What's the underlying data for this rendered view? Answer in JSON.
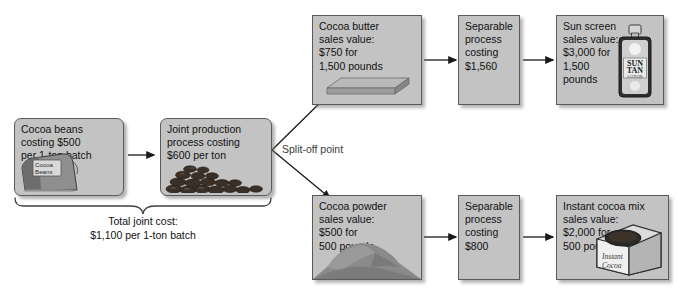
{
  "diagram": {
    "split_label": "Split-off point",
    "joint_cost_note": "Total joint cost:\n$1,100 per 1-ton batch",
    "colors": {
      "box_fill": "#c3c3c3",
      "box_border": "#5a5a5a",
      "text": "#111111",
      "split_label": "#3a3a3a",
      "background": "#ffffff"
    },
    "boxes": {
      "cocoa_beans": {
        "text": "Cocoa beans\ncosting $500\nper 1-ton batch",
        "icon": "cocoa-beans-sack",
        "icon_label": "Cocoa\nBeans"
      },
      "joint_process": {
        "text": "Joint production\nprocess costing\n$600 per ton",
        "icon": "cocoa-bean-pile"
      },
      "cocoa_butter": {
        "text": "Cocoa butter\nsales value:\n$750 for\n1,500 pounds",
        "icon": "butter-bar"
      },
      "separable_upper": {
        "text": "Separable\nprocess\ncosting\n$1,560"
      },
      "sun_screen": {
        "text": "Sun screen\nsales value:\n$3,000 for\n1,500\npounds",
        "icon": "sun-tan-lotion-bottle",
        "icon_label_1": "SUN",
        "icon_label_2": "TAN",
        "icon_label_3": "LOTION"
      },
      "cocoa_powder": {
        "text": "Cocoa powder\nsales value:\n$500 for\n500 pounds",
        "icon": "cocoa-powder-mound"
      },
      "separable_lower": {
        "text": "Separable\nprocess\ncosting\n$800"
      },
      "instant_cocoa_mix": {
        "text": "Instant cocoa mix\nsales value:\n$2,000 for\n500 pounds",
        "icon": "instant-cocoa-tin",
        "icon_label": "Instant\nCocoa"
      }
    }
  }
}
